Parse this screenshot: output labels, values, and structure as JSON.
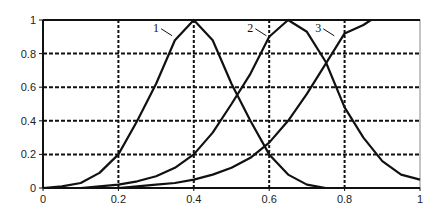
{
  "chart_data": {
    "type": "line",
    "title": "",
    "xlabel": "",
    "ylabel": "",
    "xlim": [
      0,
      1
    ],
    "ylim": [
      0,
      1
    ],
    "grid": true,
    "grid_style": "dashed",
    "legend": "inline numeric labels 1, 2, 3 near curve tops",
    "x_ticks": [
      "0",
      "0.2",
      "0.4",
      "0.6",
      "0.8",
      "1"
    ],
    "y_ticks": [
      "0",
      "0.2",
      "0.4",
      "0.6",
      "0.8",
      "1"
    ],
    "series": [
      {
        "name": "1",
        "x": [
          0.0,
          0.05,
          0.1,
          0.15,
          0.2,
          0.25,
          0.3,
          0.35,
          0.4,
          0.45,
          0.5,
          0.55,
          0.6,
          0.65,
          0.7,
          0.75
        ],
        "values": [
          0.0,
          0.01,
          0.03,
          0.09,
          0.2,
          0.4,
          0.62,
          0.88,
          1.0,
          0.88,
          0.62,
          0.4,
          0.2,
          0.08,
          0.02,
          0.0
        ]
      },
      {
        "name": "2",
        "x": [
          0.05,
          0.1,
          0.15,
          0.2,
          0.25,
          0.3,
          0.35,
          0.4,
          0.45,
          0.5,
          0.55,
          0.6,
          0.65,
          0.7,
          0.75,
          0.8,
          0.85,
          0.9,
          0.95,
          1.0
        ],
        "values": [
          0.0,
          0.0,
          0.01,
          0.02,
          0.04,
          0.07,
          0.12,
          0.2,
          0.33,
          0.5,
          0.68,
          0.9,
          1.0,
          0.93,
          0.75,
          0.48,
          0.3,
          0.16,
          0.08,
          0.05
        ]
      },
      {
        "name": "3",
        "x": [
          0.15,
          0.2,
          0.25,
          0.3,
          0.35,
          0.4,
          0.45,
          0.5,
          0.55,
          0.6,
          0.65,
          0.7,
          0.75,
          0.8,
          0.85,
          0.87,
          0.9,
          0.95,
          1.0
        ],
        "values": [
          0.0,
          0.0,
          0.01,
          0.02,
          0.03,
          0.05,
          0.08,
          0.12,
          0.18,
          0.27,
          0.4,
          0.56,
          0.74,
          0.92,
          0.97,
          1.0,
          1.0,
          1.0,
          1.0
        ]
      }
    ],
    "annotations": [
      {
        "text": "1",
        "x": 0.3,
        "y": 0.93
      },
      {
        "text": "2",
        "x": 0.55,
        "y": 0.93
      },
      {
        "text": "3",
        "x": 0.73,
        "y": 0.93
      }
    ]
  },
  "colors": {
    "line": "#111111",
    "grid": "#111111",
    "background": "#ffffff"
  }
}
